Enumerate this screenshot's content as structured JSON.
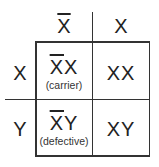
{
  "header": {
    "columns": [
      {
        "allele": "X",
        "barred": true
      },
      {
        "allele": "X",
        "barred": false
      }
    ],
    "rows": [
      {
        "allele": "X",
        "barred": false
      },
      {
        "allele": "Y",
        "barred": false
      }
    ]
  },
  "cells": [
    {
      "row": 0,
      "col": 0,
      "barred_part": "X",
      "rest": "X",
      "note": "(carrier)"
    },
    {
      "row": 0,
      "col": 1,
      "barred_part": "",
      "rest": "XX",
      "note": ""
    },
    {
      "row": 1,
      "col": 0,
      "barred_part": "X",
      "rest": "Y",
      "note": "(defective)"
    },
    {
      "row": 1,
      "col": 1,
      "barred_part": "",
      "rest": "XY",
      "note": ""
    }
  ],
  "colors": {
    "line": "#333333",
    "text": "#222222",
    "background": "#ffffff"
  }
}
